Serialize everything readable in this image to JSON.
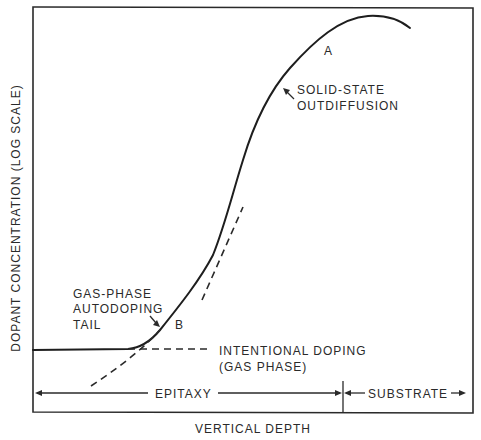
{
  "diagram": {
    "type": "dopant concentration profile (epitaxy autodoping)",
    "axes": {
      "ylabel": "DOPANT CONCENTRATION (LOG SCALE)",
      "xlabel": "VERTICAL DEPTH"
    },
    "labels": {
      "point_a": "A",
      "point_b": "B",
      "solid_state_line1": "SOLID-STATE",
      "solid_state_line2": "OUTDIFFUSION",
      "gas_phase_line1": "GAS-PHASE",
      "gas_phase_line2": "AUTODOPING",
      "gas_phase_line3": "TAIL",
      "intentional_line1": "INTENTIONAL DOPING",
      "intentional_line2": "(GAS PHASE)"
    },
    "regions": {
      "epitaxy": "EPITAXY",
      "substrate": "SUBSTRATE"
    },
    "curves": [
      {
        "name": "total-profile",
        "style": "solid"
      },
      {
        "name": "intentional-doping-level",
        "style": "dashed"
      },
      {
        "name": "gas-phase-autodoping-extrapolation",
        "style": "dashed"
      },
      {
        "name": "solid-state-outdiffusion-extrapolation",
        "style": "dashed"
      }
    ]
  }
}
